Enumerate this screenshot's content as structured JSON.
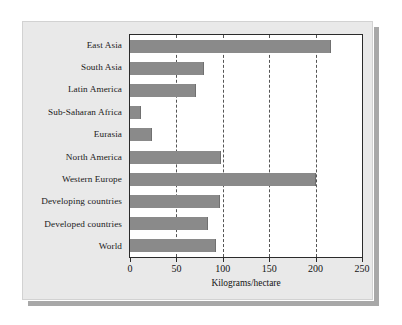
{
  "chart_data": {
    "type": "bar",
    "orientation": "horizontal",
    "title": "",
    "xlabel": "Kilograms/hectare",
    "ylabel": "",
    "xlim": [
      0,
      250
    ],
    "xticks": [
      0,
      50,
      100,
      150,
      200,
      250
    ],
    "grid": true,
    "legend": null,
    "bar_color": "#8a8a8a",
    "plot_background": "#ffffff",
    "panel_background": "#e9e9e9",
    "categories": [
      "East Asia",
      "South Asia",
      "Latin America",
      "Sub-Saharan Africa",
      "Eurasia",
      "North America",
      "Western Europe",
      "Developing countries",
      "Developed countries",
      "World"
    ],
    "values": [
      217,
      80,
      71,
      12,
      24,
      98,
      200,
      97,
      84,
      93
    ],
    "units": "Kilograms/hectare"
  }
}
